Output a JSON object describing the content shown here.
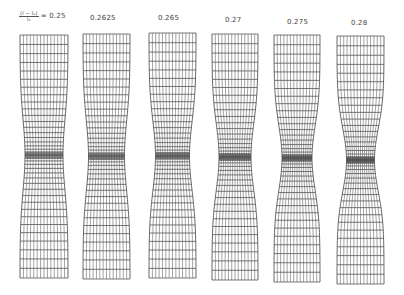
{
  "figure": {
    "strain_symbol": {
      "numerator": "(l − l₀)",
      "denominator": "l₀",
      "equals": "="
    },
    "line_color": "#555555",
    "specimens": [
      {
        "label": "0.25",
        "x0": 20,
        "x1": 68,
        "top": 35,
        "bottom": 278,
        "neck_y": 155,
        "neck_half": 19.0,
        "neck_span": 75,
        "label_x": 40,
        "label_y": 14
      },
      {
        "label": "0.2625",
        "x0": 83,
        "x1": 130,
        "top": 34,
        "bottom": 279,
        "neck_y": 156,
        "neck_half": 18.0,
        "neck_span": 74,
        "label_x": 90,
        "label_y": 14
      },
      {
        "label": "0.265",
        "x0": 149,
        "x1": 196,
        "top": 33,
        "bottom": 278,
        "neck_y": 156,
        "neck_half": 17.0,
        "neck_span": 72,
        "label_x": 158,
        "label_y": 14
      },
      {
        "label": "0.27",
        "x0": 212,
        "x1": 258,
        "top": 34,
        "bottom": 280,
        "neck_y": 157,
        "neck_half": 16.0,
        "neck_span": 70,
        "label_x": 224,
        "label_y": 16
      },
      {
        "label": "0.275",
        "x0": 274,
        "x1": 320,
        "top": 35,
        "bottom": 282,
        "neck_y": 158,
        "neck_half": 15.0,
        "neck_span": 68,
        "label_x": 286,
        "label_y": 18
      },
      {
        "label": "0.28",
        "x0": 337,
        "x1": 384,
        "top": 36,
        "bottom": 284,
        "neck_y": 160,
        "neck_half": 14.0,
        "neck_span": 66,
        "label_x": 350,
        "label_y": 19
      }
    ],
    "mesh": {
      "columns": 14,
      "rows_each_side": 20
    }
  }
}
